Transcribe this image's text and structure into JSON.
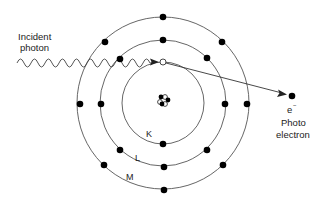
{
  "labels": {
    "incident_photon_line1": "Incident",
    "incident_photon_line2": "photon",
    "electron_symbol": "e",
    "electron_charge": "−",
    "photoelectron_line1": "Photo",
    "photoelectron_line2": "electron",
    "shell_k": "K",
    "shell_l": "L",
    "shell_m": "M"
  },
  "atom": {
    "center": [
      163,
      100
    ],
    "shells": [
      {
        "name": "K",
        "radius": 40,
        "electrons": 2,
        "note": "one electron ejected (vacancy at top)"
      },
      {
        "name": "L",
        "radius": 62,
        "electrons": 8
      },
      {
        "name": "M",
        "radius": 84,
        "electrons": 8
      }
    ],
    "nucleus": {
      "particles": 6
    }
  },
  "photon": {
    "start": [
      17,
      63
    ],
    "end": [
      157,
      63
    ],
    "amplitude": 4,
    "period": 14
  },
  "photoelectron": {
    "position": [
      292,
      96
    ]
  },
  "colors": {
    "line": "#555555",
    "electron": "#000000",
    "text": "#222222",
    "background": "#ffffff"
  }
}
